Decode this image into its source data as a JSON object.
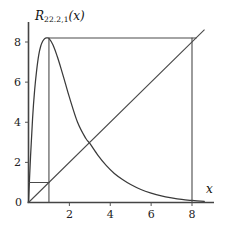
{
  "chart_data": {
    "type": "line",
    "title_base": "R",
    "title_subscript": "22.2,1",
    "title_arg": "(x)",
    "xlabel": "x",
    "ylabel": "",
    "xlim": [
      0,
      9.2
    ],
    "ylim": [
      0,
      9.6
    ],
    "grid": false,
    "legend": "none",
    "x_ticks": [
      2,
      4,
      6,
      8
    ],
    "x_tick_labels": [
      "2",
      "4",
      "6",
      "8"
    ],
    "y_ticks": [
      2,
      4,
      6,
      8
    ],
    "y_tick_labels": [
      "2",
      "4",
      "6",
      "8"
    ],
    "origin_label": "0",
    "series": [
      {
        "name": "R_{22.2,1}(x)",
        "type": "curve",
        "color": "#3a3a3a",
        "x": [
          0,
          0.1,
          0.2,
          0.3,
          0.4,
          0.5,
          0.6,
          0.7,
          0.8,
          0.9,
          1.0,
          1.2,
          1.4,
          1.6,
          1.8,
          2.0,
          2.4,
          2.8,
          3.0,
          3.4,
          3.8,
          4.2,
          4.6,
          5.0,
          5.5,
          6.0,
          6.5,
          7.0,
          7.5,
          8.0,
          8.6
        ],
        "y": [
          0,
          2.3,
          4.2,
          5.6,
          6.6,
          7.35,
          7.8,
          8.05,
          8.18,
          8.2,
          8.18,
          7.85,
          7.3,
          6.65,
          5.95,
          5.25,
          4.0,
          3.2,
          2.95,
          2.35,
          1.85,
          1.45,
          1.15,
          0.9,
          0.65,
          0.47,
          0.33,
          0.23,
          0.15,
          0.1,
          0.05
        ]
      },
      {
        "name": "identity-line",
        "type": "line",
        "color": "#4a4a4a",
        "x": [
          0,
          8.6
        ],
        "y": [
          0,
          8.6
        ]
      },
      {
        "name": "peak-plateau",
        "type": "line",
        "color": "#4a4a4a",
        "x": [
          1.0,
          8.2
        ],
        "y": [
          8.2,
          8.2
        ]
      },
      {
        "name": "peak-vertical",
        "type": "line",
        "color": "#4a4a4a",
        "x": [
          1.0,
          1.0
        ],
        "y": [
          0.0,
          8.2
        ]
      },
      {
        "name": "right-vertical",
        "type": "line",
        "color": "#4a4a4a",
        "x": [
          8.0,
          8.0
        ],
        "y": [
          0.0,
          8.2
        ]
      },
      {
        "name": "unit-box-horizontal",
        "type": "line",
        "color": "#4a4a4a",
        "x": [
          0.0,
          1.0
        ],
        "y": [
          1.0,
          1.0
        ]
      }
    ],
    "annotations": [
      {
        "name": "peak",
        "x": 1.0,
        "y": 8.2
      },
      {
        "name": "crossing",
        "x": 3.0,
        "y": 3.0
      },
      {
        "name": "right-intersection",
        "x": 8.2,
        "y": 8.2
      }
    ]
  },
  "axes": {
    "x_axis_label": "x",
    "origin": "0",
    "x_ticks": [
      "2",
      "4",
      "6",
      "8"
    ],
    "y_ticks": [
      "2",
      "4",
      "6",
      "8"
    ]
  }
}
